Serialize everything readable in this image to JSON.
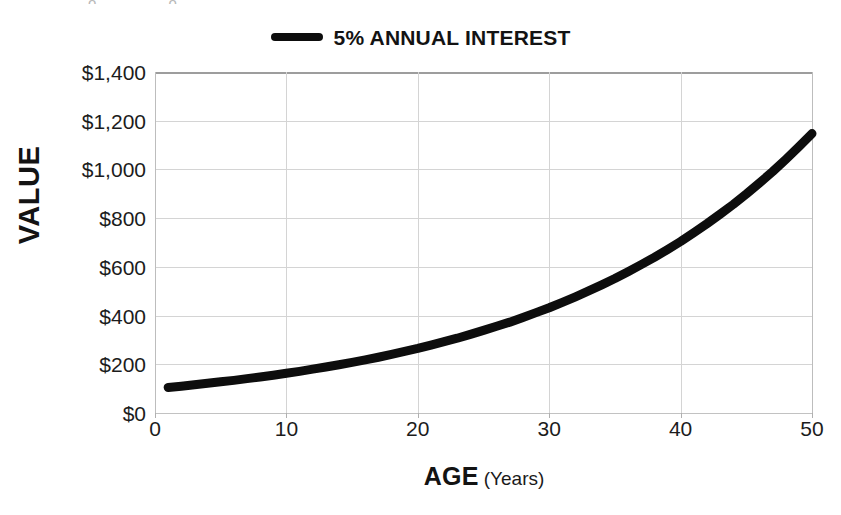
{
  "chart_data": {
    "type": "line",
    "title": "",
    "subtitle": "",
    "xlabel_main": "AGE",
    "xlabel_unit": "(Years)",
    "ylabel": "VALUE",
    "legend_position": "top-center",
    "grid": true,
    "xlim": [
      0,
      50
    ],
    "ylim": [
      0,
      1400
    ],
    "x_tick_labels": [
      "0",
      "10",
      "20",
      "30",
      "40",
      "50"
    ],
    "x_tick_values": [
      0,
      10,
      20,
      30,
      40,
      50
    ],
    "y_tick_labels": [
      "$0",
      "$200",
      "$400",
      "$600",
      "$800",
      "$1,000",
      "$1,200",
      "$1,400"
    ],
    "y_tick_values": [
      0,
      200,
      400,
      600,
      800,
      1000,
      1200,
      1400
    ],
    "series": [
      {
        "name": "5% ANNUAL INTEREST",
        "color": "#0d0d0d",
        "line_width": 9,
        "x": [
          1,
          2,
          3,
          4,
          5,
          6,
          7,
          8,
          9,
          10,
          11,
          12,
          13,
          14,
          15,
          16,
          17,
          18,
          19,
          20,
          21,
          22,
          23,
          24,
          25,
          26,
          27,
          28,
          29,
          30,
          31,
          32,
          33,
          34,
          35,
          36,
          37,
          38,
          39,
          40,
          41,
          42,
          43,
          44,
          45,
          46,
          47,
          48,
          49,
          50
        ],
        "values": [
          105,
          110,
          116,
          122,
          128,
          134,
          141,
          148,
          155,
          163,
          171,
          180,
          189,
          198,
          208,
          218,
          229,
          241,
          253,
          265,
          279,
          293,
          307,
          323,
          339,
          356,
          373,
          392,
          412,
          432,
          454,
          477,
          501,
          526,
          552,
          580,
          609,
          639,
          671,
          704,
          740,
          777,
          816,
          856,
          899,
          944,
          991,
          1041,
          1093,
          1147
        ]
      }
    ],
    "formula_note": "Value = $100 x 1.05^age"
  },
  "legend": {
    "label": "5% ANNUAL INTEREST",
    "swatch_color": "#0d0d0d"
  },
  "axes": {
    "y_title": "VALUE",
    "x_title_main": "AGE",
    "x_title_unit": "(Years)"
  },
  "colors": {
    "line": "#0d0d0d",
    "grid": "#d4d4d4",
    "text": "#131313",
    "background": "#ffffff"
  },
  "residue": {
    "top_fragment": "o o"
  }
}
